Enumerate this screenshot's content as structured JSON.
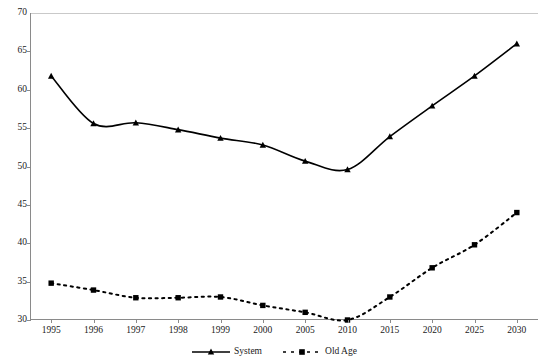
{
  "chart_data": {
    "type": "line",
    "title": "",
    "subtitle": "",
    "xlabel": "",
    "ylabel": "",
    "ylim": [
      30,
      70
    ],
    "ytick_step": 5,
    "yticks": [
      "70",
      "65",
      "60",
      "55",
      "50",
      "45",
      "40",
      "35",
      "30"
    ],
    "grid": false,
    "legend_position": "bottom",
    "categories": [
      "1995",
      "1996",
      "1997",
      "1998",
      "1999",
      "2000",
      "2005",
      "2010",
      "2015",
      "2020",
      "2025",
      "2030"
    ],
    "series": [
      {
        "name": "System",
        "marker": "triangle",
        "line_style": "solid",
        "color": "#000000",
        "values": [
          61.8,
          55.6,
          55.7,
          54.8,
          53.7,
          52.8,
          50.7,
          49.6,
          53.9,
          57.9,
          61.8,
          66.0
        ]
      },
      {
        "name": "Old Age",
        "marker": "square",
        "line_style": "dotted",
        "color": "#000000",
        "values": [
          34.8,
          33.9,
          32.9,
          32.9,
          33.0,
          31.9,
          31.0,
          30.0,
          33.0,
          36.8,
          39.8,
          44.0
        ]
      }
    ]
  },
  "legend": {
    "items": [
      {
        "label": "System"
      },
      {
        "label": "Old Age"
      }
    ]
  },
  "colors": {
    "axis": "#8a8a8a",
    "series": "#000000",
    "text": "#1a1a1a",
    "background": "#ffffff"
  }
}
